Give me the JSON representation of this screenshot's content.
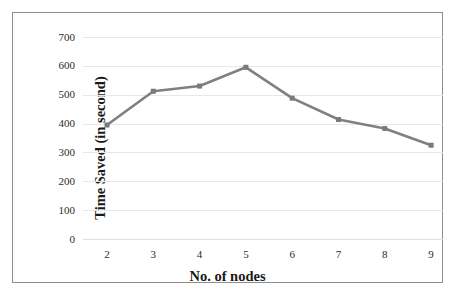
{
  "chart_data": {
    "type": "line",
    "title": "",
    "xlabel": "No. of nodes",
    "ylabel": "Time Saved (in second)",
    "categories": [
      "2",
      "3",
      "4",
      "5",
      "6",
      "7",
      "8",
      "9"
    ],
    "x": [
      2,
      3,
      4,
      5,
      6,
      7,
      8,
      9
    ],
    "values": [
      395,
      512,
      530,
      595,
      488,
      414,
      383,
      325
    ],
    "series": [
      {
        "name": "Time Saved",
        "values": [
          395,
          512,
          530,
          595,
          488,
          414,
          383,
          325
        ]
      }
    ],
    "ylim": [
      0,
      700
    ],
    "yticks": [
      0,
      100,
      200,
      300,
      400,
      500,
      600,
      700
    ],
    "ytick_labels": [
      "0",
      "100",
      "200",
      "300",
      "400",
      "500",
      "600",
      "700"
    ],
    "xtick_labels": [
      "2",
      "3",
      "4",
      "5",
      "6",
      "7",
      "8",
      "9"
    ],
    "grid": "horizontal",
    "legend": "none",
    "line_color": "#808080",
    "marker_color": "#7a7a7a",
    "marker": "square",
    "gridline_color": "#e8e8e8",
    "border_color": "#8d8d8d",
    "background_color": "#ffffff",
    "text_color": "#2b2b2b"
  }
}
